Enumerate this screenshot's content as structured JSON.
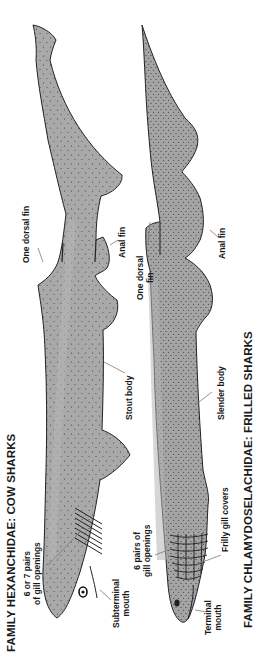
{
  "diagram": {
    "colors": {
      "body_fill": "#a9a9a9",
      "outline": "#222222",
      "stipple": "#3a3a3a",
      "leader": "#777777",
      "background": "#ffffff"
    },
    "sharks": [
      {
        "id": "cow-shark",
        "title": "FAMILY HEXANCHIDAE: COW SHARKS",
        "labels": {
          "gill": "6 or 7 pairs of gill openings",
          "gill_line1": "6 or 7 pairs",
          "gill_line2": "of gill openings",
          "mouth_line1": "Subterminal",
          "mouth_line2": "mouth",
          "body": "Stout body",
          "dorsal": "One dorsal fin",
          "anal": "Anal fin"
        }
      },
      {
        "id": "frilled-shark",
        "title": "FAMILY CHLAMYDOSELACHIDAE: FRILLED SHARKS",
        "labels": {
          "gill_line1": "6 pairs of",
          "gill_line2": "gill openings",
          "mouth_line1": "Terminal",
          "mouth_line2": "mouth",
          "frill": "Frilly gill covers",
          "body": "Slender body",
          "dorsal_line1": "One dorsal",
          "dorsal_line2": "fin",
          "anal": "Anal fin"
        }
      }
    ]
  }
}
